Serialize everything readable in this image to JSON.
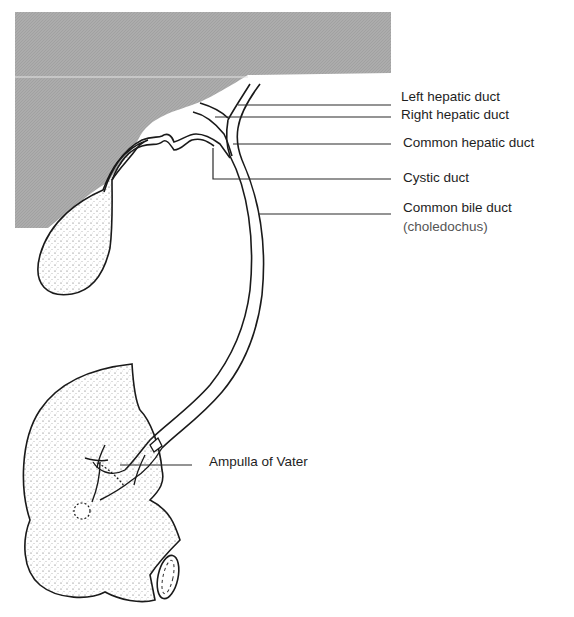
{
  "diagram": {
    "colors": {
      "liver_shade": "#a9a9a9",
      "outline": "#1a1a1a",
      "background": "#ffffff"
    },
    "labels": [
      {
        "id": "left-hepatic-duct",
        "text": "Left hepatic duct"
      },
      {
        "id": "right-hepatic-duct",
        "text": "Right hepatic duct"
      },
      {
        "id": "common-hepatic-duct",
        "text": "Common hepatic duct"
      },
      {
        "id": "cystic-duct",
        "text": "Cystic duct"
      },
      {
        "id": "common-bile-duct",
        "text": "Common bile duct",
        "subtext": "(choledochus)"
      },
      {
        "id": "ampulla-of-vater",
        "text": "Ampulla of Vater"
      }
    ],
    "structures": [
      "liver",
      "gallbladder",
      "cystic duct",
      "hepatic ducts",
      "common bile duct",
      "duodenum",
      "pancreatic duct",
      "ampulla of Vater"
    ]
  }
}
